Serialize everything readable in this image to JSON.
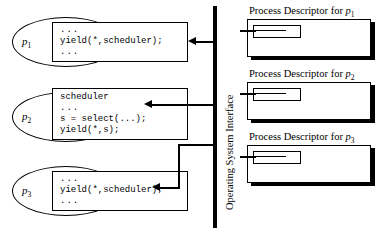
{
  "diagram": {
    "width": 377,
    "height": 234,
    "stroke_color": "#000000",
    "background_color": "#ffffff"
  },
  "os_interface": {
    "label": "Operating System Interface"
  },
  "processes": [
    {
      "id": "p1",
      "label_base": "p",
      "label_sub": "1",
      "code": [
        "...",
        "yield(*,scheduler);",
        "..."
      ]
    },
    {
      "id": "p2",
      "label_base": "p",
      "label_sub": "2",
      "code": [
        "scheduler",
        "...",
        "s = select(...);",
        "yield(*,s);"
      ]
    },
    {
      "id": "p3",
      "label_base": "p",
      "label_sub": "3",
      "code": [
        "...",
        "yield(*,scheduler);",
        "..."
      ]
    }
  ],
  "descriptors": [
    {
      "id": "pd1",
      "title_prefix": "Process Descriptor for ",
      "title_base": "p",
      "title_sub": "1"
    },
    {
      "id": "pd2",
      "title_prefix": "Process Descriptor for ",
      "title_base": "p",
      "title_sub": "2"
    },
    {
      "id": "pd3",
      "title_prefix": "Process Descriptor for ",
      "title_base": "p",
      "title_sub": "3"
    }
  ]
}
